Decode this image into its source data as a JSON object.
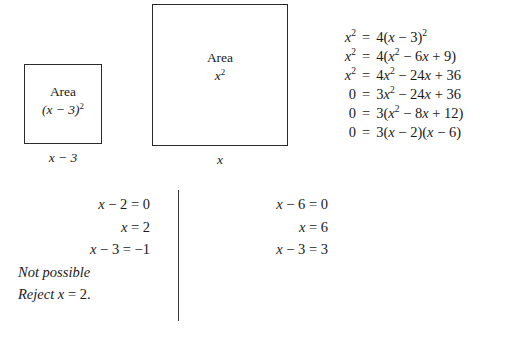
{
  "figure": {
    "small_square": {
      "area_label": "Area",
      "area_expression_open": "(",
      "area_expression": "x − 3)",
      "area_exponent": "2",
      "side_label": "x − 3"
    },
    "large_square": {
      "area_label": "Area",
      "area_expression": "x",
      "area_exponent": "2",
      "side_label": "x"
    }
  },
  "derivation": {
    "rows": [
      {
        "lhs": "x",
        "lhs_exp": "2",
        "eq": "=",
        "rhs": "4(x − 3)",
        "rhs_exp": "2"
      },
      {
        "lhs": "x",
        "lhs_exp": "2",
        "eq": "=",
        "rhs": "4(x² − 6x + 9)",
        "rhs_exp": ""
      },
      {
        "lhs": "x",
        "lhs_exp": "2",
        "eq": "=",
        "rhs": "4x² − 24x + 36",
        "rhs_exp": ""
      },
      {
        "lhs": "0",
        "lhs_exp": "",
        "eq": "=",
        "rhs": "3x² − 24x + 36",
        "rhs_exp": ""
      },
      {
        "lhs": "0",
        "lhs_exp": "",
        "eq": "=",
        "rhs": "3(x² − 8x + 12)",
        "rhs_exp": ""
      },
      {
        "lhs": "0",
        "lhs_exp": "",
        "eq": "=",
        "rhs": "3(x − 2)(x − 6)",
        "rhs_exp": ""
      }
    ]
  },
  "cases": {
    "left": {
      "lines": [
        {
          "text": "x − 2 = 0",
          "align": "right"
        },
        {
          "text": "x = 2",
          "align": "right"
        },
        {
          "text": "x − 3 = −1",
          "align": "right"
        },
        {
          "text": "Not possible",
          "align": "left"
        },
        {
          "text": "Reject x = 2.",
          "align": "left"
        }
      ]
    },
    "right": {
      "lines": [
        {
          "text": "x − 6 = 0",
          "align": "right"
        },
        {
          "text": "x = 6",
          "align": "right"
        },
        {
          "text": "x − 3 = 3",
          "align": "right"
        }
      ]
    }
  },
  "colors": {
    "ink": "#1a1a1a",
    "stroke": "#2b2b2b",
    "background": "#ffffff"
  }
}
